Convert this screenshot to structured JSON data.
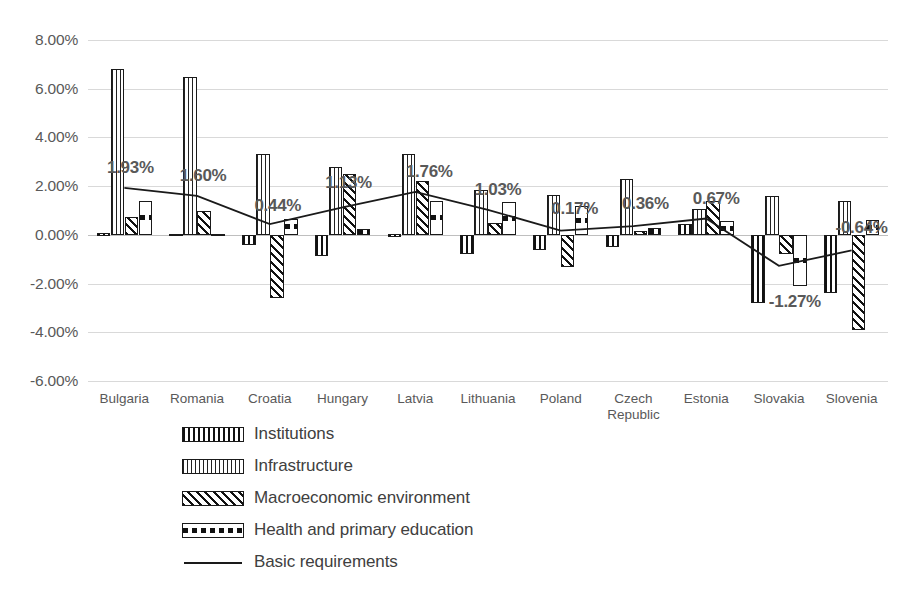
{
  "chart_data": {
    "type": "bar",
    "title": "",
    "subtitle": "",
    "xlabel": "",
    "ylabel": "",
    "ylim": [
      -6,
      8
    ],
    "ytick_values": [
      8,
      6,
      4,
      2,
      0,
      -2,
      -4,
      -6
    ],
    "ytick_labels": [
      "8.00%",
      "6.00%",
      "4.00%",
      "2.00%",
      "0.00%",
      "-2.00%",
      "-4.00%",
      "-6.00%"
    ],
    "grid": true,
    "legend_position": "bottom",
    "categories": [
      "Bulgaria",
      "Romania",
      "Croatia",
      "Hungary",
      "Latvia",
      "Lithuania",
      "Poland",
      "Czech\nRepublic",
      "Estonia",
      "Slovakia",
      "Slovenia"
    ],
    "series": [
      {
        "name": "Institutions",
        "pattern": "vertical-stripes",
        "values": [
          0.06,
          0.05,
          -0.42,
          -0.85,
          0.02,
          -0.8,
          -0.62,
          -0.5,
          0.45,
          -2.8,
          -2.4
        ]
      },
      {
        "name": "Infrastructure",
        "pattern": "dotted",
        "values": [
          6.8,
          6.5,
          3.3,
          2.8,
          3.3,
          1.85,
          1.65,
          2.3,
          1.05,
          1.6,
          1.4
        ]
      },
      {
        "name": "Macroeconomic environment",
        "pattern": "diagonal-hatch",
        "values": [
          0.75,
          1.0,
          -2.6,
          2.5,
          2.2,
          0.5,
          -1.3,
          0.15,
          1.4,
          -0.8,
          -3.9
        ]
      },
      {
        "name": "Health and primary education",
        "pattern": "dashed",
        "values": [
          1.4,
          0.05,
          0.65,
          0.25,
          1.4,
          1.35,
          1.2,
          0.3,
          0.55,
          -2.1,
          0.6
        ]
      }
    ],
    "line_series": {
      "name": "Basic requirements",
      "style": "solid-line",
      "values": [
        1.93,
        1.6,
        0.44,
        1.13,
        1.76,
        1.03,
        0.17,
        0.36,
        0.67,
        -1.27,
        -0.64
      ],
      "labels": [
        "1.93%",
        "1.60%",
        "0.44%",
        "1.13%",
        "1.76%",
        "1.03%",
        "0.17%",
        "0.36%",
        "0.67%",
        "-1.27%",
        "-0.64%"
      ]
    },
    "legend_entries": [
      "Institutions",
      "Infrastructure",
      "Macroeconomic environment",
      "Health and primary education",
      "Basic requirements"
    ],
    "colors": {
      "bar_outline": "#1a1a1a",
      "line": "#1a1a1a",
      "gridline": "#d9d9d9",
      "text": "#595959"
    }
  }
}
